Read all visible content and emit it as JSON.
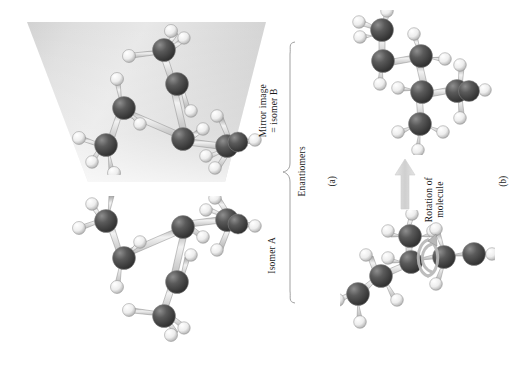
{
  "figure": {
    "background_color": "#ffffff",
    "panels": [
      {
        "id": "a",
        "label": "(a)"
      },
      {
        "id": "b",
        "label": "(b)"
      }
    ],
    "labels": {
      "isomer_a": "Isomer A",
      "mirror_image_line1": "Mirror image",
      "mirror_image_line2": "= isomer B",
      "enantiomers": "Enantiomers",
      "rotation_line1": "Rotation of",
      "rotation_line2": "molecule"
    },
    "colors": {
      "carbon": "#4a4a4a",
      "carbon_highlight": "#9d9d9d",
      "hydrogen": "#f2f2f2",
      "hydrogen_shade": "#b9b9b9",
      "bond": "#c9c9c9",
      "bond_edge": "#8f8f8f",
      "mirror_plane_light": "#e9e9e9",
      "mirror_plane_dark": "#c6c6c6",
      "arrow": "#d6d6d6",
      "bracket": "#9a9a9a",
      "text": "#1a1a1a"
    },
    "molecules": [
      {
        "name": "isomer-b-mirror-image",
        "panel": "a",
        "position": "top-left",
        "on_mirror_plane": true,
        "atom_counts": {
          "carbon": 6,
          "hydrogen": 13
        }
      },
      {
        "name": "isomer-a",
        "panel": "a",
        "position": "bottom-left",
        "on_mirror_plane": false,
        "atom_counts": {
          "carbon": 6,
          "hydrogen": 13
        }
      },
      {
        "name": "isomer-rotated-result",
        "panel": "b",
        "position": "top-right",
        "on_mirror_plane": false,
        "atom_counts": {
          "carbon": 6,
          "hydrogen": 13
        }
      },
      {
        "name": "isomer-before-rotation",
        "panel": "b",
        "position": "bottom-right",
        "on_mirror_plane": false,
        "has_rotation_arrow": true,
        "atom_counts": {
          "carbon": 6,
          "hydrogen": 13
        }
      }
    ]
  }
}
